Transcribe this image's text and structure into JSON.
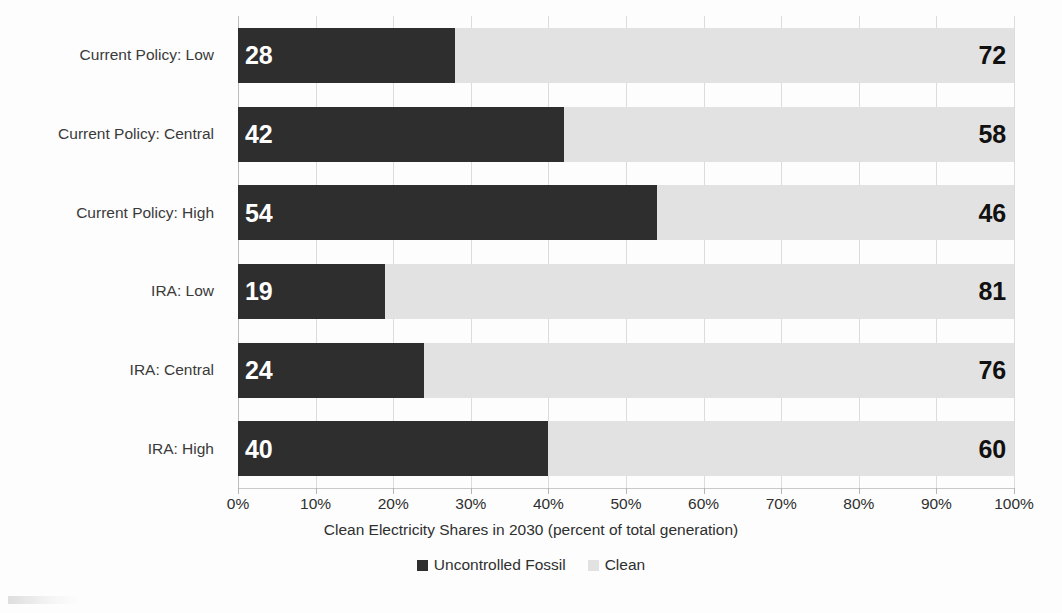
{
  "chart_data": {
    "type": "bar",
    "orientation": "horizontal",
    "stacked": true,
    "normalized_percent": true,
    "title": "",
    "xlabel": "Clean Electricity Shares in 2030 (percent of total generation)",
    "ylabel": "",
    "xlim": [
      0,
      100
    ],
    "xticks": [
      0,
      10,
      20,
      30,
      40,
      50,
      60,
      70,
      80,
      90,
      100
    ],
    "xtick_labels": [
      "0%",
      "10%",
      "20%",
      "30%",
      "40%",
      "50%",
      "60%",
      "70%",
      "80%",
      "90%",
      "100%"
    ],
    "grid": true,
    "grid_axis": "x",
    "legend_position": "bottom-center",
    "categories": [
      "Current Policy: Low",
      "Current Policy: Central",
      "Current Policy: High",
      "IRA: Low",
      "IRA: Central",
      "IRA: High"
    ],
    "series": [
      {
        "name": "Uncontrolled Fossil",
        "color": "#2e2e2e",
        "values": [
          28,
          42,
          54,
          19,
          24,
          40
        ]
      },
      {
        "name": "Clean",
        "color": "#e2e2e2",
        "values": [
          72,
          58,
          46,
          81,
          76,
          60
        ]
      }
    ],
    "bars": [
      {
        "category": "Current Policy: Low",
        "fossil": 28,
        "clean": 72
      },
      {
        "category": "Current Policy: Central",
        "fossil": 42,
        "clean": 58
      },
      {
        "category": "Current Policy: High",
        "fossil": 54,
        "clean": 46
      },
      {
        "category": "IRA: Low",
        "fossil": 19,
        "clean": 81
      },
      {
        "category": "IRA: Central",
        "fossil": 24,
        "clean": 76
      },
      {
        "category": "IRA: High",
        "fossil": 40,
        "clean": 60
      }
    ]
  },
  "legend": {
    "items": [
      {
        "label": "Uncontrolled Fossil",
        "swatch": "fossil"
      },
      {
        "label": "Clean",
        "swatch": "clean"
      }
    ]
  },
  "colors": {
    "fossil": "#2e2e2e",
    "clean": "#e2e2e2",
    "gridline": "#dcdcdc",
    "axis": "#c9c9c9",
    "text": "#2f2f2f",
    "category_text": "#3a3a3a",
    "background": "#fdfdfd"
  }
}
